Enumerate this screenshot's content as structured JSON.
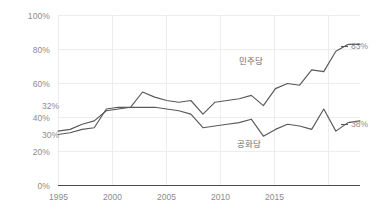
{
  "chart_data": {
    "type": "line",
    "title": "",
    "xlabel": "",
    "ylabel": "",
    "xlim": [
      1994,
      2019
    ],
    "ylim": [
      0,
      100
    ],
    "grid": true,
    "legend_position": "inline",
    "y_ticks": [
      "0%",
      "20%",
      "40%",
      "60%",
      "80%",
      "100%"
    ],
    "y_tick_values": [
      0,
      20,
      40,
      60,
      80,
      100
    ],
    "x_ticks": [
      "1995",
      "2000",
      "2005",
      "2010",
      "2015"
    ],
    "x_tick_values": [
      1995,
      2000,
      2005,
      2010,
      2015
    ],
    "series": [
      {
        "name": "민주당",
        "color": "#595959",
        "label_start": "32%",
        "label_end": "83%",
        "x": [
          1994,
          1995,
          1996,
          1997,
          1998,
          1999,
          2000,
          2001,
          2002,
          2003,
          2004,
          2005,
          2006,
          2007,
          2008,
          2009,
          2010,
          2011,
          2012,
          2013,
          2014,
          2015,
          2016,
          2017,
          2018,
          2019
        ],
        "values": [
          32,
          33,
          36,
          38,
          44,
          45,
          46,
          55,
          52,
          50,
          49,
          50,
          42,
          49,
          50,
          51,
          53,
          47,
          57,
          60,
          59,
          68,
          67,
          79,
          83,
          83
        ]
      },
      {
        "name": "공화당",
        "color": "#595959",
        "label_start": "30%",
        "label_end": "38%",
        "x": [
          1994,
          1995,
          1996,
          1997,
          1998,
          1999,
          2000,
          2001,
          2002,
          2003,
          2004,
          2005,
          2006,
          2007,
          2008,
          2009,
          2010,
          2011,
          2012,
          2013,
          2014,
          2015,
          2016,
          2017,
          2018,
          2019
        ],
        "values": [
          30,
          31,
          33,
          34,
          45,
          46,
          46,
          46,
          46,
          45,
          44,
          42,
          34,
          35,
          36,
          37,
          39,
          29,
          33,
          36,
          35,
          33,
          45,
          32,
          37,
          38
        ]
      }
    ]
  },
  "axes": {
    "y_labels": [
      "100%",
      "80%",
      "60%",
      "40%",
      "20%",
      "0%"
    ],
    "x_labels": [
      "1995",
      "2000",
      "2005",
      "2010",
      "2015"
    ]
  },
  "annotations": {
    "democrat_name": "민주당",
    "republican_name": "공화당",
    "democrat_start": "32%",
    "republican_start": "30%",
    "democrat_end": "83%",
    "republican_end": "38%"
  },
  "colors": {
    "line": "#595959",
    "grid": "#e6e6e6",
    "axis": "#595959",
    "tick_text": "#8c8c8c",
    "label_text": "#6b6b6b",
    "background": "#ffffff"
  }
}
